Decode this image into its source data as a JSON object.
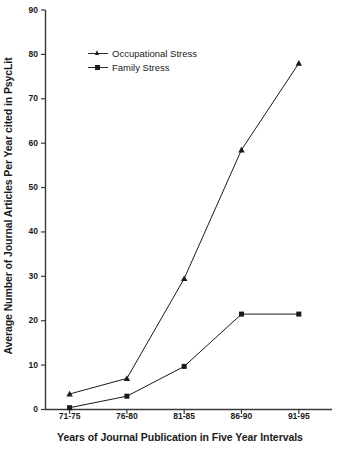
{
  "chart_data": {
    "type": "line",
    "title": "",
    "xlabel": "Years of Journal Publication in Five Year Intervals",
    "ylabel": "Average Number of Journal Articles Per Year cited in PsycLit",
    "categories": [
      "71-75",
      "76-80",
      "81-85",
      "86-90",
      "91-95"
    ],
    "ylim": [
      0,
      90
    ],
    "yticks": [
      0,
      10,
      20,
      30,
      40,
      50,
      60,
      70,
      80,
      90
    ],
    "ytick_labels": [
      "0",
      "10",
      "20",
      "30",
      "40",
      "50",
      "60",
      "70",
      "80",
      "90"
    ],
    "grid": false,
    "legend_position": "upper-left-inside",
    "series": [
      {
        "name": "Occupational Stress",
        "marker": "triangle",
        "color": "#1a1a1a",
        "values": [
          3.5,
          7.0,
          29.5,
          58.5,
          78.0
        ]
      },
      {
        "name": "Family Stress",
        "marker": "square",
        "color": "#1a1a1a",
        "values": [
          0.4,
          3.0,
          9.7,
          21.5,
          21.5
        ]
      }
    ]
  },
  "legend": {
    "items": [
      {
        "label": "Occupational Stress"
      },
      {
        "label": "Family Stress"
      }
    ]
  },
  "axes": {
    "y_title": "Average Number of Journal Articles Per Year cited in PsycLit",
    "x_title": "Years of Journal Publication in Five Year Intervals"
  }
}
